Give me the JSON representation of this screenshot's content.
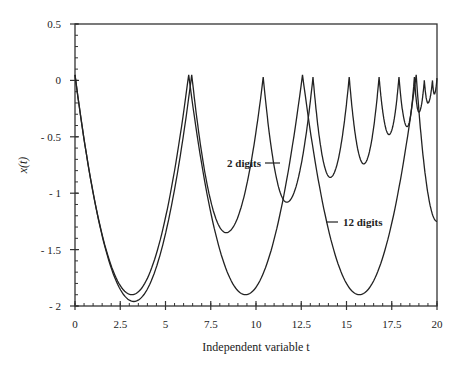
{
  "chart_data": {
    "type": "line",
    "title": "",
    "xlabel": "Independent variable t",
    "ylabel": "x(t)",
    "xlim": [
      0,
      20
    ],
    "ylim": [
      -2,
      0.5
    ],
    "xticks": [
      0,
      2.5,
      5,
      7.5,
      10,
      12.5,
      15,
      17.5,
      20
    ],
    "xtick_labels": [
      "0",
      "2.5",
      "5",
      "7.5",
      "10",
      "12.5",
      "15",
      "17.5",
      "20"
    ],
    "yticks": [
      0.5,
      0,
      -0.5,
      -1,
      -1.5,
      -2
    ],
    "ytick_labels": [
      "0.5",
      "0",
      "- 0.5",
      "- 1",
      "- 1.5",
      "- 2"
    ],
    "grid": false,
    "legend": "inline annotations",
    "annotations": [
      {
        "text": "2 digits",
        "x": 9.5,
        "y": -0.5
      },
      {
        "text": "12 digits",
        "x": 12.8,
        "y": -1.3
      }
    ],
    "series": [
      {
        "name": "12 digits",
        "description": "periodic cycloid-like arches of period ~2π, peaks ≈0.05, minima ≈-1.9",
        "peaks": [
          [
            0,
            0.05
          ],
          [
            6.28,
            0.05
          ],
          [
            12.57,
            0.05
          ],
          [
            18.85,
            0.05
          ]
        ],
        "minima": [
          [
            3.14,
            -1.9
          ],
          [
            9.42,
            -1.9
          ],
          [
            15.71,
            -1.9
          ]
        ],
        "end": [
          20,
          -1.25
        ]
      },
      {
        "name": "2 digits",
        "description": "arches with shrinking period and amplitude",
        "peaks": [
          [
            0,
            0.05
          ],
          [
            6.45,
            0.05
          ],
          [
            10.4,
            0.03
          ],
          [
            13.15,
            0.03
          ],
          [
            15.15,
            0.03
          ],
          [
            16.8,
            0.03
          ],
          [
            17.9,
            0.03
          ],
          [
            18.75,
            0.03
          ],
          [
            19.3,
            0.0
          ],
          [
            19.75,
            0.0
          ],
          [
            20,
            0.02
          ]
        ],
        "minima": [
          [
            3.25,
            -1.96
          ],
          [
            8.35,
            -1.35
          ],
          [
            11.7,
            -1.08
          ],
          [
            14.1,
            -0.86
          ],
          [
            15.95,
            -0.74
          ],
          [
            17.35,
            -0.48
          ],
          [
            18.35,
            -0.41
          ],
          [
            19.0,
            -0.28
          ],
          [
            19.5,
            -0.2
          ],
          [
            19.85,
            -0.12
          ]
        ]
      }
    ]
  }
}
